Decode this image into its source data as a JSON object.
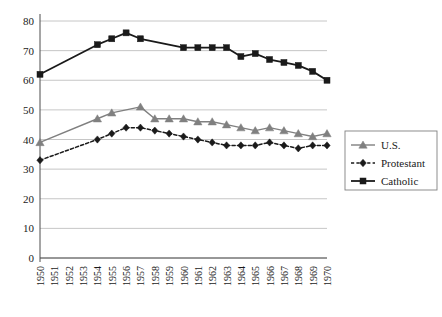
{
  "chart_data": {
    "type": "line",
    "title": "",
    "subtitle": "",
    "xlabel": "",
    "ylabel": "",
    "xlim": [
      1950,
      1970
    ],
    "ylim": [
      0,
      80
    ],
    "ytick_values": [
      0,
      10,
      20,
      30,
      40,
      50,
      60,
      70,
      80
    ],
    "ytick_labels": [
      "0",
      "10",
      "20",
      "30",
      "40",
      "50",
      "60",
      "70",
      "80"
    ],
    "grid": "horizontal",
    "legend_position": "right-middle",
    "categories": [
      1950,
      1951,
      1952,
      1953,
      1954,
      1955,
      1956,
      1957,
      1958,
      1959,
      1960,
      1961,
      1962,
      1963,
      1964,
      1965,
      1966,
      1967,
      1968,
      1969,
      1970
    ],
    "xtick_labels": [
      "1950",
      "1951",
      "1952",
      "1953",
      "1954",
      "1955",
      "1956",
      "1957",
      "1958",
      "1959",
      "1960",
      "1961",
      "1962",
      "1963",
      "1964",
      "1965",
      "1966",
      "1967",
      "1968",
      "1969",
      "1970"
    ],
    "series": [
      {
        "name": "U.S.",
        "marker": "triangle",
        "linestyle": "solid",
        "color": "#808080",
        "values": [
          39,
          null,
          null,
          null,
          47,
          49,
          null,
          51,
          47,
          47,
          47,
          46,
          46,
          45,
          44,
          43,
          44,
          43,
          42,
          41,
          42
        ]
      },
      {
        "name": "Protestant",
        "marker": "diamond",
        "linestyle": "dashed",
        "color": "#1a1a1a",
        "values": [
          33,
          null,
          null,
          null,
          40,
          42,
          44,
          44,
          43,
          42,
          41,
          40,
          39,
          38,
          38,
          38,
          39,
          38,
          37,
          38,
          38
        ]
      },
      {
        "name": "Catholic",
        "marker": "square",
        "linestyle": "solid",
        "color": "#1a1a1a",
        "values": [
          62,
          null,
          null,
          null,
          72,
          74,
          76,
          74,
          null,
          null,
          71,
          71,
          71,
          71,
          68,
          69,
          67,
          66,
          65,
          63,
          60
        ]
      }
    ],
    "legend_entries": [
      {
        "label": "U.S.",
        "marker": "triangle",
        "linestyle": "solid",
        "color": "#808080"
      },
      {
        "label": "Protestant",
        "marker": "diamond",
        "linestyle": "dashed",
        "color": "#1a1a1a"
      },
      {
        "label": "Catholic",
        "marker": "square",
        "linestyle": "solid",
        "color": "#1a1a1a"
      }
    ],
    "colors": {
      "us": "#808080",
      "protestant": "#1a1a1a",
      "catholic": "#1a1a1a",
      "grid": "#b8b8b8",
      "axis": "#4d4d4d",
      "background": "#ffffff"
    }
  }
}
